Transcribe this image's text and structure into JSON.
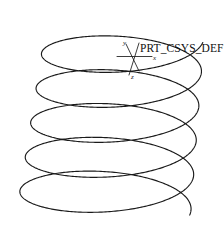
{
  "drawing": {
    "title": "Helical Sweep Spring",
    "background_color": "#ffffff",
    "line_color": "#1a1a1a"
  },
  "csys": {
    "name": "PRT_CSYS_DEF",
    "name_x": 140,
    "name_y": 52,
    "origin_x": 132,
    "origin_y": 56,
    "axes": [
      {
        "label": "x",
        "label_x": 153,
        "label_y": 60,
        "x1": 117,
        "y1": 56.5,
        "x2": 152,
        "y2": 56.5
      },
      {
        "label": "y",
        "label_x": 123,
        "label_y": 45,
        "x1": 126,
        "y1": 44,
        "x2": 139,
        "y2": 71
      },
      {
        "label": "z",
        "label_x": 131,
        "label_y": 79,
        "x1": 139,
        "y1": 43,
        "x2": 129,
        "y2": 75
      }
    ]
  },
  "chart_data": {
    "type": "line",
    "xlabel": "",
    "ylabel": "",
    "grid": false,
    "legend": "none",
    "turns": 5,
    "center_x_top": 124,
    "center_x_bottom": 104,
    "center_y_top": 38,
    "center_y_bottom": 210,
    "radius_x_top": 80,
    "radius_x_bottom": 87,
    "radius_y_top": 26,
    "radius_y_bottom": 29,
    "start_angle_deg": 10,
    "end_angle_deg": 1810,
    "samples": 1400
  }
}
